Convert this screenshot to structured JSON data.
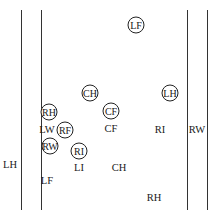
{
  "diagram": {
    "type": "field-positions",
    "lines": [
      {
        "id": "outer-left",
        "x": 21,
        "y1": 10,
        "y2": 210
      },
      {
        "id": "inner-left",
        "x": 41,
        "y1": 10,
        "y2": 210
      },
      {
        "id": "inner-right",
        "x": 187,
        "y1": 10,
        "y2": 210
      },
      {
        "id": "outer-right",
        "x": 207,
        "y1": 10,
        "y2": 210
      }
    ],
    "circled": [
      {
        "label": "LF",
        "x": 136,
        "y": 25
      },
      {
        "label": "CH",
        "x": 90,
        "y": 93
      },
      {
        "label": "LH",
        "x": 170,
        "y": 93
      },
      {
        "label": "CF",
        "x": 111,
        "y": 111
      },
      {
        "label": "RH",
        "x": 49,
        "y": 112
      },
      {
        "label": "RF",
        "x": 65,
        "y": 130
      },
      {
        "label": "RW",
        "x": 50,
        "y": 146
      },
      {
        "label": "RI",
        "x": 79,
        "y": 151
      }
    ],
    "plain": [
      {
        "label": "CF",
        "x": 111,
        "y": 129
      },
      {
        "label": "LW",
        "x": 47,
        "y": 130
      },
      {
        "label": "RI",
        "x": 160,
        "y": 130
      },
      {
        "label": "RW",
        "x": 197,
        "y": 130
      },
      {
        "label": "LH",
        "x": 10,
        "y": 165
      },
      {
        "label": "LI",
        "x": 79,
        "y": 168
      },
      {
        "label": "CH",
        "x": 119,
        "y": 168
      },
      {
        "label": "LF",
        "x": 47,
        "y": 181
      },
      {
        "label": "RH",
        "x": 154,
        "y": 198
      }
    ]
  }
}
